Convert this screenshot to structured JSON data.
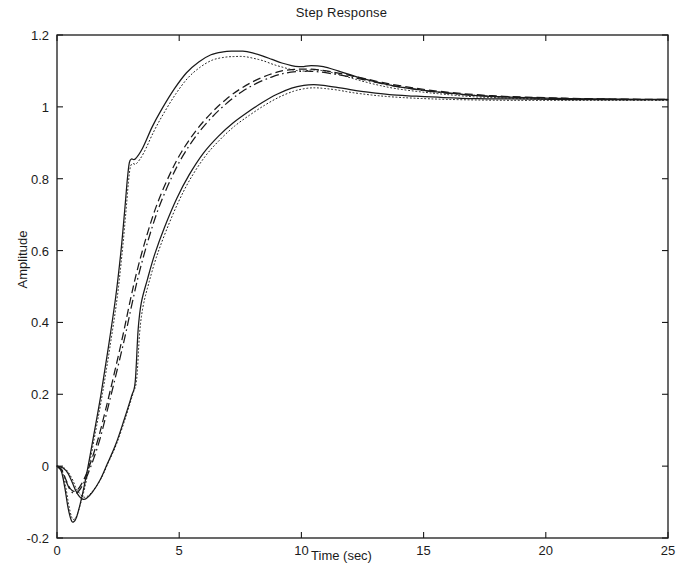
{
  "chart_data": {
    "type": "line",
    "title": "Step Response",
    "xlabel": "Time (sec)",
    "ylabel": "Amplitude",
    "xlim": [
      0,
      25
    ],
    "ylim": [
      -0.2,
      1.2
    ],
    "xticks": [
      0,
      5,
      10,
      15,
      20,
      25
    ],
    "yticks": [
      -0.2,
      0,
      0.2,
      0.4,
      0.6,
      0.8,
      1,
      1.2
    ],
    "xtick_labels": [
      "0",
      "5",
      "10",
      "15",
      "20",
      "25"
    ],
    "ytick_labels": [
      "-0.2",
      "0",
      "0.2",
      "0.4",
      "0.6",
      "0.8",
      "1",
      "1.2"
    ],
    "grid": false,
    "legend": null,
    "line_color": "#1a1a1a",
    "frame_color": "#1a1a1a",
    "background": "#ffffff",
    "annotations": [
      "Upper envelope overshoots to about 1.155 near t = 7.6 s",
      "Middle nominal responses peak near 1.105 at t = 10 s",
      "Lower envelope peaks near 1.06 at t = 10.5 s",
      "All responses show initial undershoot below zero before t = 1 s",
      "A kink appears near t = 3 s around amplitude 0.85",
      "All responses settle to approximately 1.02"
    ],
    "series": [
      {
        "name": "upper-envelope-solid",
        "style": "solid",
        "x": [
          0,
          0.18,
          0.32,
          0.45,
          0.58,
          0.68,
          0.8,
          0.95,
          1.1,
          1.3,
          1.5,
          1.8,
          2.1,
          2.4,
          2.62,
          2.78,
          2.88,
          2.96,
          3.05,
          3.2,
          3.5,
          3.9,
          4.3,
          4.8,
          5.3,
          5.8,
          6.3,
          6.8,
          7.2,
          7.6,
          8.0,
          8.4,
          8.8,
          9.2,
          9.6,
          9.9,
          10.1,
          10.4,
          10.9,
          11.5,
          12.2,
          13.0,
          13.8,
          14.8,
          15.8,
          17.0,
          18.2,
          19.5,
          21.0,
          22.5,
          24.0,
          25
        ],
        "y": [
          0,
          -0.015,
          -0.06,
          -0.115,
          -0.15,
          -0.155,
          -0.142,
          -0.105,
          -0.06,
          0.01,
          0.085,
          0.2,
          0.33,
          0.47,
          0.6,
          0.72,
          0.8,
          0.845,
          0.855,
          0.855,
          0.885,
          0.945,
          0.995,
          1.05,
          1.095,
          1.125,
          1.145,
          1.153,
          1.155,
          1.155,
          1.15,
          1.142,
          1.132,
          1.122,
          1.115,
          1.112,
          1.112,
          1.115,
          1.112,
          1.1,
          1.085,
          1.07,
          1.058,
          1.048,
          1.04,
          1.032,
          1.028,
          1.025,
          1.023,
          1.022,
          1.021,
          1.021
        ]
      },
      {
        "name": "upper-envelope-dotted",
        "style": "dotted",
        "x": [
          0,
          0.2,
          0.35,
          0.48,
          0.6,
          0.7,
          0.82,
          0.98,
          1.15,
          1.35,
          1.55,
          1.85,
          2.15,
          2.45,
          2.66,
          2.82,
          2.92,
          3.0,
          3.1,
          3.25,
          3.55,
          3.95,
          4.35,
          4.85,
          5.35,
          5.85,
          6.35,
          6.85,
          7.25,
          7.65,
          8.05,
          8.45,
          8.85,
          9.25,
          9.65,
          9.95,
          10.15,
          10.45,
          10.95,
          11.55,
          12.25,
          13.05,
          13.85,
          14.85,
          15.85,
          17.05,
          18.25,
          19.55,
          21.05,
          22.55,
          24.05,
          25
        ],
        "y": [
          0,
          -0.012,
          -0.055,
          -0.108,
          -0.142,
          -0.148,
          -0.136,
          -0.1,
          -0.056,
          0.013,
          0.086,
          0.198,
          0.325,
          0.462,
          0.59,
          0.708,
          0.788,
          0.832,
          0.842,
          0.842,
          0.872,
          0.93,
          0.98,
          1.035,
          1.08,
          1.11,
          1.13,
          1.138,
          1.14,
          1.14,
          1.135,
          1.128,
          1.118,
          1.11,
          1.103,
          1.1,
          1.1,
          1.103,
          1.1,
          1.09,
          1.076,
          1.062,
          1.051,
          1.042,
          1.035,
          1.028,
          1.025,
          1.022,
          1.021,
          1.02,
          1.02,
          1.02
        ]
      },
      {
        "name": "middle-dashed",
        "style": "dashed",
        "x": [
          0,
          0.2,
          0.35,
          0.5,
          0.62,
          0.72,
          0.85,
          1.0,
          1.2,
          1.45,
          1.7,
          2.0,
          2.35,
          2.7,
          3.0,
          3.3,
          3.7,
          4.1,
          4.6,
          5.1,
          5.7,
          6.3,
          6.9,
          7.5,
          8.1,
          8.7,
          9.2,
          9.7,
          10.0,
          10.3,
          10.7,
          11.2,
          11.8,
          12.5,
          13.3,
          14.2,
          15.2,
          16.4,
          17.8,
          19.2,
          20.8,
          22.4,
          24.0,
          25
        ],
        "y": [
          0,
          -0.01,
          -0.035,
          -0.058,
          -0.068,
          -0.07,
          -0.065,
          -0.05,
          -0.022,
          0.025,
          0.08,
          0.16,
          0.26,
          0.365,
          0.462,
          0.55,
          0.648,
          0.73,
          0.81,
          0.875,
          0.935,
          0.982,
          1.02,
          1.05,
          1.073,
          1.09,
          1.1,
          1.104,
          1.105,
          1.105,
          1.103,
          1.098,
          1.09,
          1.08,
          1.068,
          1.057,
          1.047,
          1.038,
          1.031,
          1.027,
          1.024,
          1.022,
          1.021,
          1.021
        ]
      },
      {
        "name": "middle-dash-dot",
        "style": "dashdot",
        "x": [
          0,
          0.2,
          0.36,
          0.52,
          0.64,
          0.74,
          0.88,
          1.04,
          1.24,
          1.5,
          1.76,
          2.06,
          2.42,
          2.78,
          3.08,
          3.38,
          3.78,
          4.18,
          4.68,
          5.18,
          5.78,
          6.38,
          6.98,
          7.58,
          8.18,
          8.78,
          9.28,
          9.78,
          10.08,
          10.38,
          10.78,
          11.28,
          11.88,
          12.58,
          13.38,
          14.28,
          15.28,
          16.48,
          17.88,
          19.28,
          20.88,
          22.48,
          24.05,
          25
        ],
        "y": [
          0,
          -0.012,
          -0.04,
          -0.064,
          -0.074,
          -0.076,
          -0.07,
          -0.054,
          -0.026,
          0.021,
          0.076,
          0.156,
          0.256,
          0.36,
          0.455,
          0.543,
          0.64,
          0.722,
          0.802,
          0.867,
          0.927,
          0.974,
          1.012,
          1.043,
          1.066,
          1.083,
          1.093,
          1.098,
          1.099,
          1.099,
          1.097,
          1.092,
          1.085,
          1.075,
          1.063,
          1.053,
          1.043,
          1.035,
          1.029,
          1.025,
          1.023,
          1.021,
          1.02,
          1.02
        ]
      },
      {
        "name": "lower-envelope-solid",
        "style": "solid",
        "x": [
          0,
          0.25,
          0.45,
          0.62,
          0.78,
          0.92,
          1.05,
          1.2,
          1.45,
          1.75,
          2.05,
          2.4,
          2.75,
          3.05,
          3.2,
          3.32,
          3.45,
          3.7,
          4.0,
          4.4,
          4.9,
          5.4,
          6.0,
          6.6,
          7.2,
          7.8,
          8.4,
          9.0,
          9.6,
          10.1,
          10.5,
          10.9,
          11.4,
          12.0,
          12.8,
          13.6,
          14.6,
          15.8,
          17.2,
          18.6,
          20.2,
          21.8,
          23.4,
          25
        ],
        "y": [
          0,
          -0.005,
          -0.02,
          -0.045,
          -0.07,
          -0.085,
          -0.092,
          -0.09,
          -0.072,
          -0.04,
          0.005,
          0.06,
          0.13,
          0.195,
          0.235,
          0.38,
          0.455,
          0.52,
          0.59,
          0.665,
          0.745,
          0.81,
          0.872,
          0.918,
          0.955,
          0.985,
          1.012,
          1.035,
          1.052,
          1.06,
          1.062,
          1.06,
          1.055,
          1.048,
          1.04,
          1.034,
          1.03,
          1.026,
          1.023,
          1.022,
          1.021,
          1.02,
          1.02,
          1.02
        ]
      },
      {
        "name": "lower-envelope-dotted",
        "style": "dotted",
        "x": [
          0,
          0.27,
          0.47,
          0.65,
          0.8,
          0.95,
          1.08,
          1.24,
          1.5,
          1.8,
          2.1,
          2.45,
          2.8,
          3.1,
          3.26,
          3.38,
          3.52,
          3.76,
          4.06,
          4.46,
          4.96,
          5.46,
          6.06,
          6.66,
          7.26,
          7.86,
          8.46,
          9.06,
          9.66,
          10.16,
          10.56,
          10.96,
          11.46,
          12.06,
          12.86,
          13.66,
          14.66,
          15.86,
          17.26,
          18.66,
          20.26,
          21.86,
          23.46,
          25
        ],
        "y": [
          0,
          -0.004,
          -0.018,
          -0.04,
          -0.064,
          -0.078,
          -0.086,
          -0.084,
          -0.066,
          -0.035,
          0.01,
          0.064,
          0.134,
          0.2,
          0.242,
          0.37,
          0.444,
          0.51,
          0.58,
          0.654,
          0.734,
          0.8,
          0.862,
          0.908,
          0.946,
          0.976,
          1.003,
          1.026,
          1.043,
          1.051,
          1.053,
          1.051,
          1.047,
          1.04,
          1.033,
          1.028,
          1.024,
          1.021,
          1.019,
          1.018,
          1.018,
          1.018,
          1.018,
          1.018
        ]
      }
    ]
  },
  "plot_geometry": {
    "left": 57,
    "top": 35,
    "right": 668,
    "bottom": 538
  }
}
